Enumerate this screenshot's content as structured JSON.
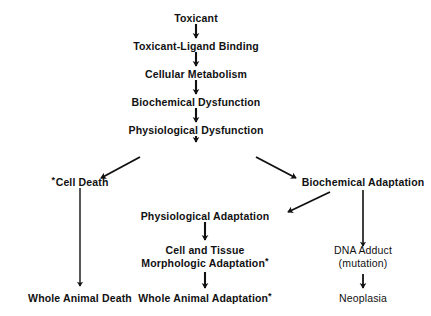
{
  "diagram": {
    "background_color": "#ffffff",
    "ink_color": "#111111",
    "nodes": {
      "toxicant": {
        "label": "Toxicant"
      },
      "toxicant_ligand_binding": {
        "label": "Toxicant-Ligand Binding"
      },
      "cellular_metabolism": {
        "label": "Cellular Metabolism"
      },
      "biochemical_dysfunction": {
        "label": "Biochemical Dysfunction"
      },
      "physiological_dysfunction": {
        "label": "Physiological Dysfunction"
      },
      "cell_death": {
        "label": "Cell Death",
        "marker": "*",
        "marker_position": "leading"
      },
      "biochemical_adaptation": {
        "label": "Biochemical Adaptation"
      },
      "physiological_adaptation": {
        "label": "Physiological Adaptation"
      },
      "cell_tissue_morphologic_adaptation": {
        "line1": "Cell and Tissue",
        "line2": "Morphologic Adaptation",
        "marker": "*",
        "marker_position": "trailing"
      },
      "dna_adduct": {
        "line1": "DNA  Adduct",
        "line2": "(mutation)"
      },
      "whole_animal_death": {
        "label": "Whole  Animal  Death"
      },
      "whole_animal_adaptation": {
        "label": "Whole  Animal  Adaptation",
        "marker": "*",
        "marker_position": "trailing"
      },
      "neoplasia": {
        "label": "Neoplasia"
      }
    },
    "edges": [
      {
        "from": "toxicant",
        "to": "toxicant_ligand_binding",
        "kind": "vertical"
      },
      {
        "from": "toxicant_ligand_binding",
        "to": "cellular_metabolism",
        "kind": "vertical"
      },
      {
        "from": "cellular_metabolism",
        "to": "biochemical_dysfunction",
        "kind": "vertical"
      },
      {
        "from": "biochemical_dysfunction",
        "to": "physiological_dysfunction",
        "kind": "vertical"
      },
      {
        "from": "physiological_dysfunction",
        "to": "cell_death",
        "kind": "diagonal-left"
      },
      {
        "from": "physiological_dysfunction",
        "to": "biochemical_adaptation",
        "kind": "diagonal-right"
      },
      {
        "from": "biochemical_adaptation",
        "to": "physiological_adaptation",
        "kind": "diagonal-left"
      },
      {
        "from": "cell_death",
        "to": "whole_animal_death",
        "kind": "vertical-long"
      },
      {
        "from": "physiological_adaptation",
        "to": "cell_tissue_morphologic_adaptation",
        "kind": "vertical"
      },
      {
        "from": "cell_tissue_morphologic_adaptation",
        "to": "whole_animal_adaptation",
        "kind": "vertical"
      },
      {
        "from": "biochemical_adaptation",
        "to": "dna_adduct",
        "kind": "vertical-long"
      },
      {
        "from": "dna_adduct",
        "to": "neoplasia",
        "kind": "vertical"
      }
    ]
  }
}
